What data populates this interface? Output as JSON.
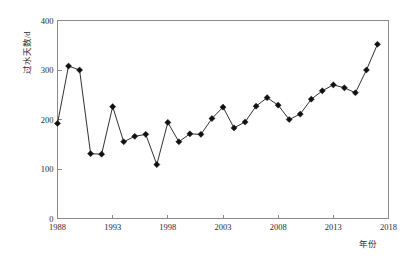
{
  "chart_data": {
    "type": "line",
    "title": "",
    "subtitle": "",
    "xlabel": "年份",
    "ylabel": "过水天数/d",
    "xlim": [
      1988,
      2018
    ],
    "ylim": [
      0,
      400
    ],
    "xticks": [
      1988,
      1993,
      1998,
      2003,
      2008,
      2013,
      2018
    ],
    "yticks": [
      0,
      100,
      200,
      300,
      400
    ],
    "grid": false,
    "legend": null,
    "marker": "diamond",
    "line_color": "#111111",
    "marker_color": "#111111",
    "x": [
      1988,
      1989,
      1990,
      1991,
      1992,
      1993,
      1994,
      1995,
      1996,
      1997,
      1998,
      1999,
      2000,
      2001,
      2002,
      2003,
      2004,
      2005,
      2006,
      2007,
      2008,
      2009,
      2010,
      2011,
      2012,
      2013,
      2014,
      2015,
      2016,
      2017,
      2018
    ],
    "values": [
      192,
      308,
      300,
      131,
      130,
      226,
      155,
      166,
      170,
      109,
      194,
      155,
      171,
      170,
      202,
      225,
      183,
      195,
      227,
      244,
      229,
      200,
      211,
      241,
      258,
      270,
      264,
      254,
      300,
      352,
      352
    ],
    "series": [
      {
        "name": "过水天数",
        "x": [
          1988,
          1989,
          1990,
          1991,
          1992,
          1993,
          1994,
          1995,
          1996,
          1997,
          1998,
          1999,
          2000,
          2001,
          2002,
          2003,
          2004,
          2005,
          2006,
          2007,
          2008,
          2009,
          2010,
          2011,
          2012,
          2013,
          2014,
          2015,
          2016,
          2017
        ],
        "values": [
          192,
          308,
          300,
          131,
          130,
          226,
          155,
          166,
          170,
          109,
          194,
          155,
          171,
          170,
          202,
          225,
          183,
          195,
          227,
          244,
          229,
          200,
          211,
          241,
          258,
          270,
          264,
          254,
          300,
          352
        ]
      }
    ]
  },
  "axes": {
    "y_title": "过水天数/d",
    "x_title": "年份",
    "y_tick_labels": [
      "0",
      "100",
      "200",
      "300",
      "400"
    ],
    "x_tick_labels": [
      "1988",
      "1993",
      "1998",
      "2003",
      "2008",
      "2013",
      "2018"
    ]
  }
}
